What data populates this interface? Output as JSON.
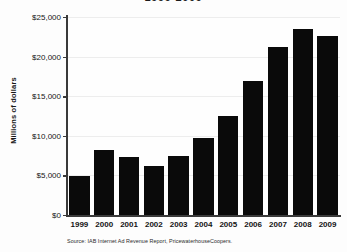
{
  "chart_data": {
    "type": "bar",
    "title": "1999-2009",
    "xlabel": "",
    "ylabel": "Millions of dollars",
    "categories": [
      "1999",
      "2000",
      "2001",
      "2002",
      "2003",
      "2004",
      "2005",
      "2006",
      "2007",
      "2008",
      "2009"
    ],
    "values": [
      4900,
      8250,
      7300,
      6200,
      7400,
      9700,
      12550,
      16900,
      21200,
      23450,
      22650
    ],
    "ylim": [
      0,
      25000
    ],
    "ytick_values": [
      0,
      5000,
      10000,
      15000,
      20000,
      25000
    ],
    "ytick_labels": [
      "$0",
      "$5,000",
      "$10,000",
      "$15,000",
      "$20,000",
      "$25,000"
    ],
    "grid": true,
    "legend": "none",
    "bar_color": "#0a0a0a",
    "axis_color": "#3a3a3a",
    "grid_color": "#ededed",
    "background_color": "#fdfdfd"
  },
  "source": {
    "note": "Source: IAB Internet Ad Revenue Report, PricewaterhouseCoopers."
  }
}
